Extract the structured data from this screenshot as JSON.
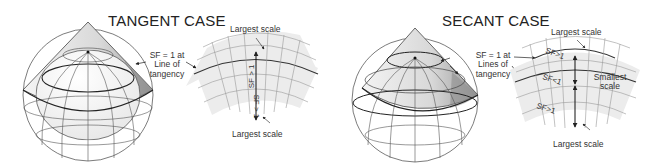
{
  "tangent": {
    "title": "TANGENT CASE",
    "callout": {
      "line1": "SF = 1 at",
      "line2": "Line of",
      "line3": "tangency"
    },
    "top_label": "Largest scale",
    "bottom_label": "Largest scale",
    "upper_sf": "SF > 1",
    "lower_sf": "SF > 1"
  },
  "secant": {
    "title": "SECANT CASE",
    "callout": {
      "line1": "SF = 1 at",
      "line2": "Lines of",
      "line3": "tangency"
    },
    "top_label": "Largest scale",
    "bottom_label": "Largest scale",
    "smallest": {
      "line1": "Smallest",
      "line2": "scale"
    },
    "sf_top": "SF>1",
    "sf_mid": "SF<1",
    "sf_bottom": "SF>1"
  }
}
